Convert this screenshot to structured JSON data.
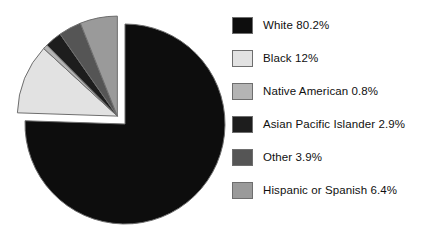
{
  "chart_data": {
    "type": "pie",
    "title": "",
    "subtitle": "",
    "xlabel": "",
    "ylabel": "",
    "grid": false,
    "legend_position": "right",
    "exploded": true,
    "start_angle_deg": 90,
    "direction": "clockwise",
    "note_sum_percent": 106.2,
    "categories": [
      "White",
      "Black",
      "Native American",
      "Asian Pacific Islander",
      "Other",
      "Hispanic or Spanish"
    ],
    "values": [
      80.2,
      12,
      0.8,
      2.9,
      3.9,
      6.4
    ],
    "value_labels": [
      "80.2%",
      "12%",
      "0.8%",
      "2.9%",
      "3.9%",
      "6.4%"
    ],
    "colors": [
      "#0d0d0d",
      "#e2e2e2",
      "#b4b4b4",
      "#1d1d1d",
      "#555555",
      "#9a9a9a"
    ],
    "slice_edge_color": "#6e6e6e",
    "exploded_slices": [
      "Black",
      "Native American",
      "Asian Pacific Islander",
      "Other",
      "Hispanic or Spanish"
    ]
  },
  "legend": {
    "items": [
      {
        "label": "White 80.2%",
        "name": "White",
        "value": "80.2%",
        "color": "#0d0d0d"
      },
      {
        "label": "Black 12%",
        "name": "Black",
        "value": "12%",
        "color": "#e2e2e2"
      },
      {
        "label": "Native American 0.8%",
        "name": "Native American",
        "value": "0.8%",
        "color": "#b4b4b4"
      },
      {
        "label": "Asian Pacific Islander 2.9%",
        "name": "Asian Pacific Islander",
        "value": "2.9%",
        "color": "#1d1d1d"
      },
      {
        "label": "Other 3.9%",
        "name": "Other",
        "value": "3.9%",
        "color": "#555555"
      },
      {
        "label": "Hispanic or Spanish 6.4%",
        "name": "Hispanic or Spanish",
        "value": "6.4%",
        "color": "#9a9a9a"
      }
    ]
  }
}
